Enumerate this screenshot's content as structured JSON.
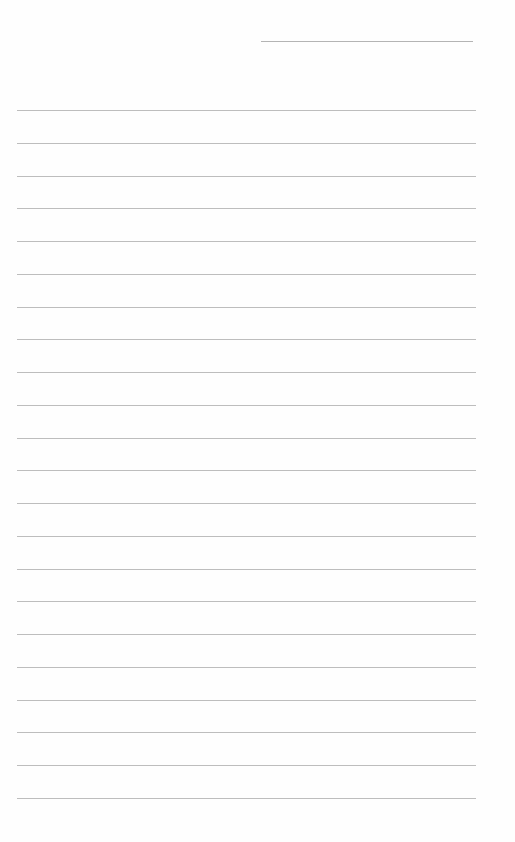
{
  "page": {
    "type": "blank lined paper",
    "header_line": {
      "present": true
    },
    "ruled_lines": {
      "count": 22,
      "color": "#bdbdbd"
    }
  }
}
